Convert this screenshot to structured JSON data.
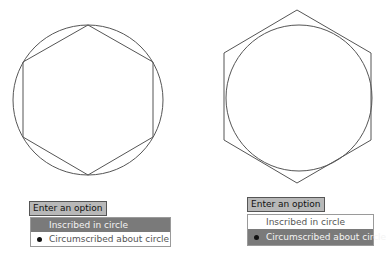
{
  "figures": {
    "left": {
      "name": "inscribed polygon",
      "description": "Hexagon inscribed in circle"
    },
    "right": {
      "name": "circumscribed polygon",
      "description": "Hexagon circumscribed about circle"
    }
  },
  "left_menu": {
    "prompt": "Enter an option",
    "items": [
      {
        "label": "Inscribed in circle",
        "highlighted": true,
        "selected": false
      },
      {
        "label": "Circumscribed about circle",
        "highlighted": false,
        "selected": true
      }
    ]
  },
  "right_menu": {
    "prompt": "Enter an option",
    "items": [
      {
        "label": "Inscribed in circle",
        "highlighted": false,
        "selected": false
      },
      {
        "label": "Circumscribed about circle",
        "highlighted": true,
        "selected": true
      }
    ]
  },
  "colors": {
    "highlight": "#7a7a7a",
    "prompt_bg": "#b8b8b8",
    "stroke": "#555555"
  }
}
